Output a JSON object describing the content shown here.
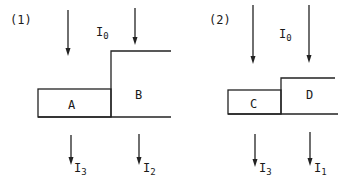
{
  "panels": [
    {
      "id": "1",
      "label": "(1)",
      "incident": {
        "symbol": "I",
        "subscript": "0"
      },
      "regions": [
        {
          "name": "A",
          "label": "A"
        },
        {
          "name": "B",
          "label": "B"
        }
      ],
      "transmitted": [
        {
          "symbol": "I",
          "subscript": "3",
          "under": "A"
        },
        {
          "symbol": "I",
          "subscript": "2",
          "under": "B"
        }
      ]
    },
    {
      "id": "2",
      "label": "(2)",
      "incident": {
        "symbol": "I",
        "subscript": "0"
      },
      "regions": [
        {
          "name": "C",
          "label": "C"
        },
        {
          "name": "D",
          "label": "D"
        }
      ],
      "transmitted": [
        {
          "symbol": "I",
          "subscript": "3",
          "under": "C"
        },
        {
          "symbol": "I",
          "subscript": "1",
          "under": "D"
        }
      ]
    }
  ],
  "colors": {
    "ink": "#222222",
    "background": "#ffffff"
  }
}
